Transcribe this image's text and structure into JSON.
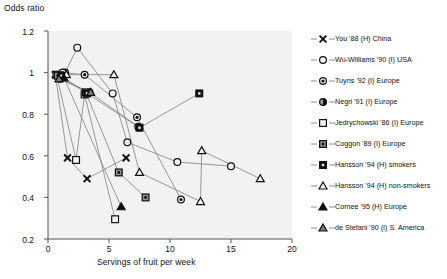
{
  "chart_data": {
    "type": "scatter",
    "title": "",
    "xlabel": "Servings of fruit per week",
    "ylabel": "Odds ratio",
    "xlim": [
      0,
      20
    ],
    "ylim": [
      0.2,
      1.2
    ],
    "xticks": [
      "0",
      "5",
      "10",
      "15",
      "20"
    ],
    "yticks": [
      "0.2",
      "0.4",
      "0.6",
      "0.8",
      "1",
      "1.2"
    ],
    "grid": false,
    "legend_position": "right",
    "plot_background": "#f2f2f2",
    "line_color": "#808080",
    "marker_color": "#111111",
    "series": [
      {
        "name": "You '88 (H) China",
        "marker": "cross",
        "points": [
          [
            0.6,
            0.99
          ],
          [
            1.6,
            0.59
          ],
          [
            3.2,
            0.49
          ],
          [
            6.4,
            0.59
          ]
        ]
      },
      {
        "name": "Wu-Williams '90 (I) USA",
        "marker": "open-circle",
        "points": [
          [
            1.4,
            1.0
          ],
          [
            2.4,
            1.12
          ],
          [
            5.3,
            0.9
          ],
          [
            6.5,
            0.665
          ],
          [
            10.6,
            0.57
          ],
          [
            15.0,
            0.55
          ]
        ]
      },
      {
        "name": "Tuyns '92 (I) Europe",
        "marker": "bullseye-circle",
        "points": [
          [
            1.2,
            1.0
          ],
          [
            3.0,
            0.99
          ],
          [
            7.3,
            0.785
          ],
          [
            10.9,
            0.39
          ]
        ]
      },
      {
        "name": "Negri '91 (I) Europe",
        "marker": "half-circle",
        "points": [
          [
            1.0,
            0.97
          ],
          [
            3.4,
            0.905
          ],
          [
            7.4,
            0.74
          ]
        ]
      },
      {
        "name": "Jedrychowski '86 (I) Europe",
        "marker": "open-square",
        "points": [
          [
            0.7,
            0.99
          ],
          [
            2.3,
            0.58
          ],
          [
            3.0,
            0.895
          ],
          [
            5.5,
            0.295
          ]
        ]
      },
      {
        "name": "Coggon '89 (I) Europe",
        "marker": "dotted-square",
        "points": [
          [
            0.8,
            0.985
          ],
          [
            3.1,
            0.905
          ],
          [
            5.8,
            0.52
          ],
          [
            8.0,
            0.4
          ]
        ]
      },
      {
        "name": "Hansson '94 (H) smokers",
        "marker": "filled-square",
        "points": [
          [
            1.1,
            0.985
          ],
          [
            3.2,
            0.9
          ],
          [
            7.5,
            0.735
          ],
          [
            12.4,
            0.9
          ]
        ]
      },
      {
        "name": "Hansson '94 (H) non-smokers",
        "marker": "open-triangle",
        "points": [
          [
            1.5,
            0.99
          ],
          [
            5.4,
            0.99
          ],
          [
            7.5,
            0.52
          ],
          [
            12.5,
            0.38
          ],
          [
            12.6,
            0.625
          ],
          [
            17.4,
            0.49
          ]
        ]
      },
      {
        "name": "Cornee '95 (H) Europe",
        "marker": "filled-triangle",
        "points": [
          [
            1.3,
            0.975
          ],
          [
            6.0,
            0.355
          ]
        ]
      },
      {
        "name": "de Stefani '90 (I) S. America",
        "marker": "shaded-triangle",
        "points": [
          [
            0.9,
            0.97
          ],
          [
            3.5,
            0.905
          ]
        ]
      }
    ]
  },
  "legend": {
    "items": [
      {
        "label": "You '88 (H) China",
        "marker": "cross"
      },
      {
        "label": "Wu-Williams '90 (I) USA",
        "marker": "open-circle"
      },
      {
        "label": "Tuyns '92 (I) Europe",
        "marker": "bullseye-circle"
      },
      {
        "label": "Negri '91 (I) Europe",
        "marker": "half-circle"
      },
      {
        "label": "Jedrychowski '86 (I) Europe",
        "marker": "open-square"
      },
      {
        "label": "Coggon '89 (I) Europe",
        "marker": "dotted-square"
      },
      {
        "label": "Hansson '94 (H) smokers",
        "marker": "filled-square"
      },
      {
        "label": "Hansson '94 (H) non-smokers",
        "marker": "open-triangle"
      },
      {
        "label": "Cornee '95 (H) Europe",
        "marker": "filled-triangle"
      },
      {
        "label": "de Stefani '90 (I) S. America",
        "marker": "shaded-triangle"
      }
    ]
  }
}
